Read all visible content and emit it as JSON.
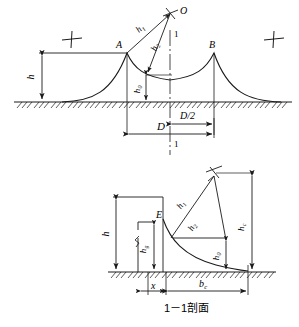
{
  "figure": {
    "caption": "1－1剖面",
    "top_view": {
      "points": [
        {
          "id": "A",
          "label": "A"
        },
        {
          "id": "B",
          "label": "B"
        },
        {
          "id": "O",
          "label": "O"
        }
      ],
      "section_marks": [
        {
          "id": "section-top",
          "label": "1"
        },
        {
          "id": "section-bottom",
          "label": "1"
        }
      ],
      "dimensions": [
        {
          "id": "h",
          "symbol": "h",
          "sub": ""
        },
        {
          "id": "h0",
          "symbol": "h",
          "sub": "0"
        },
        {
          "id": "h1",
          "symbol": "h",
          "sub": "1"
        },
        {
          "id": "h2",
          "symbol": "h",
          "sub": "2"
        },
        {
          "id": "D",
          "symbol": "D",
          "sub": ""
        },
        {
          "id": "D2",
          "symbol": "D/2",
          "sub": ""
        }
      ],
      "markers": [
        {
          "id": "cross-left",
          "symbol": "cross"
        },
        {
          "id": "cross-right",
          "symbol": "cross"
        },
        {
          "id": "turbine-O",
          "symbol": "turbine"
        }
      ]
    },
    "section_view": {
      "points": [
        {
          "id": "E",
          "label": "E"
        }
      ],
      "dimensions": [
        {
          "id": "h",
          "symbol": "h",
          "sub": ""
        },
        {
          "id": "hg",
          "symbol": "h",
          "sub": "g"
        },
        {
          "id": "h0",
          "symbol": "h",
          "sub": "0"
        },
        {
          "id": "h1",
          "symbol": "h",
          "sub": "1"
        },
        {
          "id": "h2",
          "symbol": "h",
          "sub": "2"
        },
        {
          "id": "hc",
          "symbol": "h",
          "sub": "c"
        },
        {
          "id": "x",
          "symbol": "x",
          "sub": ""
        },
        {
          "id": "bc",
          "symbol": "b",
          "sub": "c"
        }
      ],
      "markers": [
        {
          "id": "turbine-apex",
          "symbol": "turbine"
        }
      ]
    },
    "colors": {
      "line": "#1a1a1a",
      "ground": "#1a1a1a",
      "background": "#ffffff"
    }
  }
}
